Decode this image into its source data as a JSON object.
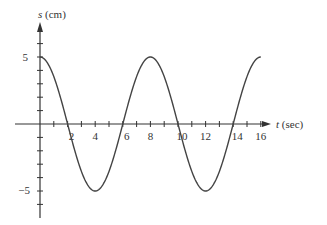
{
  "chart_data": {
    "type": "line",
    "title": "",
    "xlabel": "t (sec)",
    "ylabel": "s (cm)",
    "x_ticks": [
      2,
      4,
      6,
      8,
      10,
      12,
      14,
      16
    ],
    "y_ticks": [
      5,
      -5
    ],
    "xlim": [
      0,
      16
    ],
    "ylim": [
      -6.5,
      6.5
    ],
    "function": "s = 5 cos(pi t / 4)",
    "series": [
      {
        "name": "s(t)",
        "x": [
          0,
          2,
          4,
          6,
          8,
          10,
          12,
          14,
          16
        ],
        "values": [
          5,
          0,
          -5,
          0,
          5,
          0,
          -5,
          0,
          5
        ]
      }
    ],
    "grid": false,
    "legend": "none"
  },
  "labels": {
    "x_axis": "t (sec)",
    "y_axis_var": "s",
    "y_axis_unit": "(cm)"
  }
}
